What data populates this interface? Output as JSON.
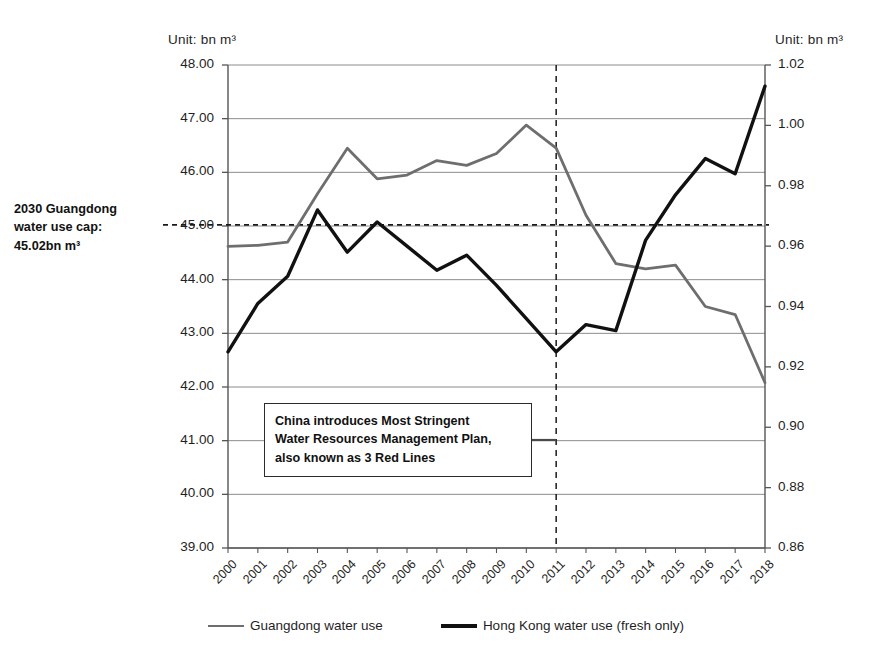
{
  "chart_data": {
    "type": "line",
    "title": "",
    "x": [
      "2000",
      "2001",
      "2002",
      "2003",
      "2004",
      "2005",
      "2006",
      "2007",
      "2008",
      "2009",
      "2010",
      "2011",
      "2012",
      "2013",
      "2014",
      "2015",
      "2016",
      "2017",
      "2018"
    ],
    "xlabel": "",
    "unit_left": "Unit: bn m³",
    "unit_right": "Unit: bn m³",
    "ylabel": "",
    "ylim": [
      39.0,
      48.0
    ],
    "yticks": [
      "39.00",
      "40.00",
      "41.00",
      "42.00",
      "43.00",
      "44.00",
      "45.00",
      "46.00",
      "47.00",
      "48.00"
    ],
    "y2lim": [
      0.86,
      1.02
    ],
    "y2ticks": [
      "0.86",
      "0.88",
      "0.90",
      "0.92",
      "0.94",
      "0.96",
      "0.98",
      "1.00",
      "1.02"
    ],
    "grid": true,
    "legend_position": "bottom",
    "series": [
      {
        "name": "Guangdong water use",
        "axis": "left",
        "color": "#6e6e6e",
        "values": [
          44.62,
          44.64,
          44.7,
          45.6,
          46.45,
          45.88,
          45.95,
          46.22,
          46.13,
          46.35,
          46.88,
          46.45,
          45.2,
          44.3,
          44.2,
          44.27,
          43.5,
          43.35,
          42.08
        ]
      },
      {
        "name": "Hong Kong water use (fresh only)",
        "axis": "right",
        "color": "#111111",
        "values": [
          0.925,
          0.941,
          0.95,
          0.972,
          0.958,
          0.968,
          0.96,
          0.952,
          0.957,
          0.947,
          0.936,
          0.925,
          0.934,
          0.932,
          0.962,
          0.977,
          0.989,
          0.984,
          1.013
        ]
      }
    ],
    "annotations": [
      {
        "name": "guangdong-water-use-cap",
        "lines": [
          "2030 Guangdong",
          "water use cap:",
          "45.02bn m³"
        ],
        "value_left_axis": 45.02,
        "style": "horizontal-dashed"
      },
      {
        "name": "china-policy-callout",
        "lines": [
          "China introduces Most Stringent",
          "Water Resources Management Plan,",
          "also known as 3 Red Lines"
        ],
        "at_x": "2011",
        "style": "vertical-dashed"
      }
    ]
  }
}
